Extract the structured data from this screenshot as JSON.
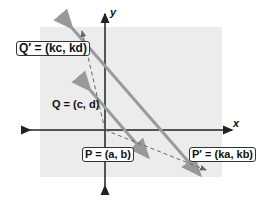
{
  "diagram": {
    "axes": {
      "x_label": "x",
      "y_label": "y"
    },
    "points": [
      {
        "id": "Q_prime",
        "label": "Q′ = (kc, kd)",
        "boxed": true
      },
      {
        "id": "Q",
        "label": "Q = (c, d)",
        "boxed": false
      },
      {
        "id": "P",
        "label": "P = (a, b)",
        "boxed": true
      },
      {
        "id": "P_prime",
        "label": "P′ = (ka, kb)",
        "boxed": true
      }
    ],
    "colors": {
      "background_region": "#ececec",
      "line": "#9a9a9a",
      "axis": "#222222",
      "dashed": "#777777"
    }
  }
}
